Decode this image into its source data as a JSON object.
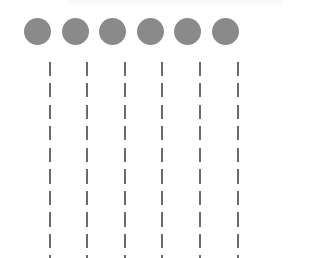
{
  "diagram": {
    "type": "lifelines",
    "node_count": 6,
    "colors": {
      "circle": "#8a8a8a",
      "dash": "#6a6a6a",
      "background": "#ffffff"
    },
    "nodes": [
      {
        "id": 1,
        "circle_x": 24,
        "line_x": 49
      },
      {
        "id": 2,
        "circle_x": 62,
        "line_x": 86
      },
      {
        "id": 3,
        "circle_x": 99,
        "line_x": 124
      },
      {
        "id": 4,
        "circle_x": 137,
        "line_x": 161
      },
      {
        "id": 5,
        "circle_x": 174,
        "line_x": 199
      },
      {
        "id": 6,
        "circle_x": 212,
        "line_x": 237
      }
    ]
  }
}
